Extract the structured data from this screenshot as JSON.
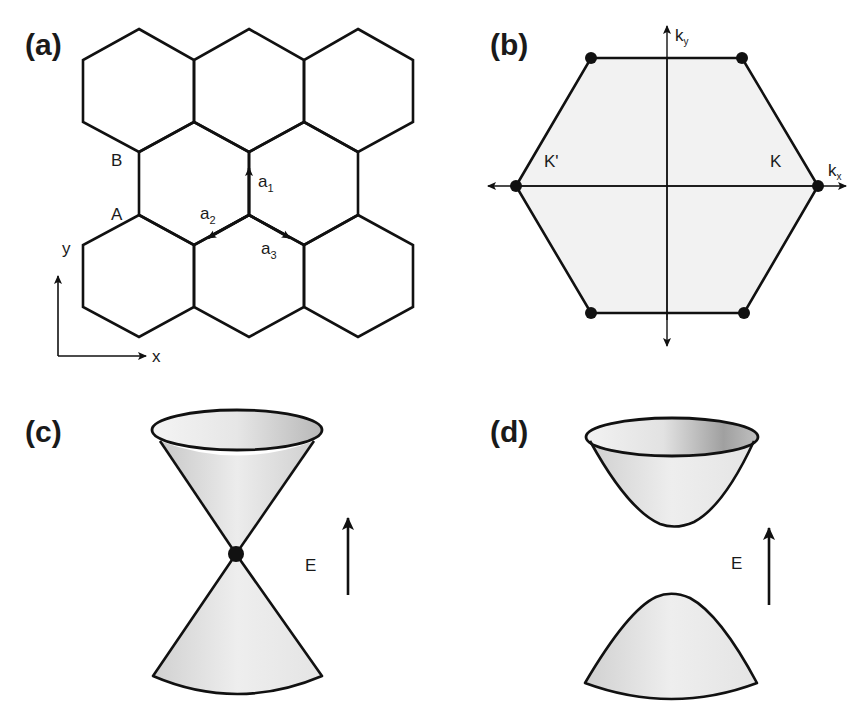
{
  "figure": {
    "panels": [
      {
        "id": "a",
        "label": "(a)",
        "title": "Honeycomb lattice in real space",
        "sublattice_labels": [
          "A",
          "B"
        ],
        "vectors": [
          {
            "name": "a",
            "sub": "1"
          },
          {
            "name": "a",
            "sub": "2"
          },
          {
            "name": "a",
            "sub": "3"
          }
        ],
        "axes": {
          "x": "x",
          "y": "y"
        }
      },
      {
        "id": "b",
        "label": "(b)",
        "title": "Hexagonal Brillouin zone",
        "points": {
          "K": "K",
          "K_prime": "K'"
        },
        "axes": {
          "kx": "k",
          "kx_sub": "x",
          "ky": "k",
          "ky_sub": "y"
        }
      },
      {
        "id": "c",
        "label": "(c)",
        "title": "Gapless Dirac cones",
        "energy_axis": "E"
      },
      {
        "id": "d",
        "label": "(d)",
        "title": "Gapped bands",
        "energy_axis": "E"
      }
    ],
    "colors": {
      "line": "#111111",
      "fill_light": "#f0f0f0",
      "fill_mid": "#d8d8d8",
      "fill_dark": "#a8a8a8"
    }
  }
}
